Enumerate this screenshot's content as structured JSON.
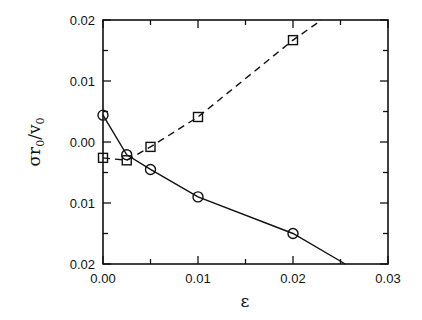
{
  "chart_data": {
    "type": "line",
    "title": "",
    "xlabel": "ε",
    "ylabel": "σr0/v0",
    "ylabel_parts": {
      "main": "σr",
      "sub1": "0",
      "slash": "/v",
      "sub2": "0"
    },
    "xlim": [
      0.0,
      0.03
    ],
    "ylim": [
      -0.02,
      0.02
    ],
    "x_ticks": [
      0.0,
      0.01,
      0.02,
      0.03
    ],
    "x_tick_labels": [
      "0.00",
      "0.01",
      "0.02",
      "0.03"
    ],
    "x_minor_ticks": [
      0.005,
      0.015,
      0.025
    ],
    "y_ticks": [
      0.02,
      0.01,
      0.0,
      -0.01,
      -0.02
    ],
    "y_tick_labels": [
      "0.02",
      "0.01",
      "0.00",
      "0.01",
      "0.02"
    ],
    "y_minor_ticks": [
      0.015,
      0.005,
      -0.005,
      -0.015
    ],
    "grid": false,
    "legend": null,
    "series": [
      {
        "name": "circles (solid line)",
        "marker": "circle",
        "line_style": "solid",
        "x": [
          0.0,
          0.0025,
          0.005,
          0.01,
          0.02
        ],
        "y": [
          0.0044,
          -0.0021,
          -0.0045,
          -0.009,
          -0.015
        ],
        "line_extends_to": [
          0.0255,
          -0.02
        ]
      },
      {
        "name": "squares (dashed line)",
        "marker": "square",
        "line_style": "dashed",
        "x": [
          0.0,
          0.0025,
          0.005,
          0.01,
          0.02
        ],
        "y": [
          -0.0026,
          -0.003,
          -0.0008,
          0.0041,
          0.0167
        ],
        "line_extends_to": [
          0.023,
          0.02
        ]
      }
    ]
  }
}
